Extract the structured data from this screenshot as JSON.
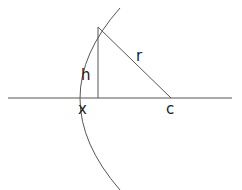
{
  "diagram": {
    "type": "geometry",
    "colors": {
      "stroke": "#555555",
      "text": "#222222",
      "background": "#ffffff"
    },
    "labels": {
      "h": "h",
      "r": "r",
      "x": "x",
      "c": "c"
    },
    "points": {
      "arc_top": [
        120,
        8
      ],
      "arc_vertex": [
        70,
        98
      ],
      "arc_bottom": [
        120,
        190
      ],
      "apex": [
        98,
        27
      ],
      "foot": [
        98,
        98
      ],
      "center": [
        171,
        98
      ]
    },
    "axis": {
      "y": 98,
      "x_start": 8,
      "x_end": 232
    }
  }
}
